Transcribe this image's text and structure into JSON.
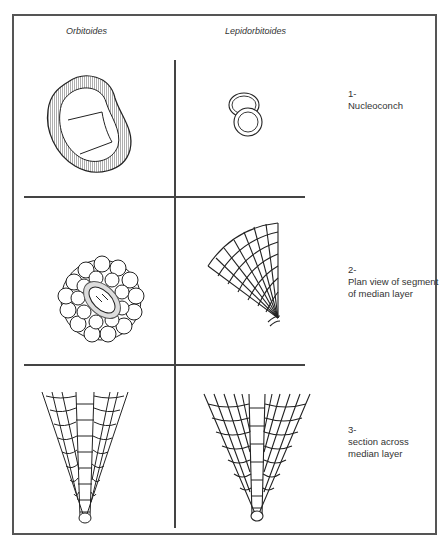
{
  "figure": {
    "columns": [
      {
        "label": "Orbitoides"
      },
      {
        "label": "Lepidorbitoides"
      }
    ],
    "rows": [
      {
        "number": "1-",
        "label": "Nucleoconch"
      },
      {
        "number": "2-",
        "label_line1": "Plan view of segment",
        "label_line2": "of median layer"
      },
      {
        "number": "3-",
        "label_line1": "section across",
        "label_line2": "median layer"
      }
    ]
  },
  "colors": {
    "line": "#222222",
    "frame": "#555555",
    "background": "#ffffff"
  }
}
